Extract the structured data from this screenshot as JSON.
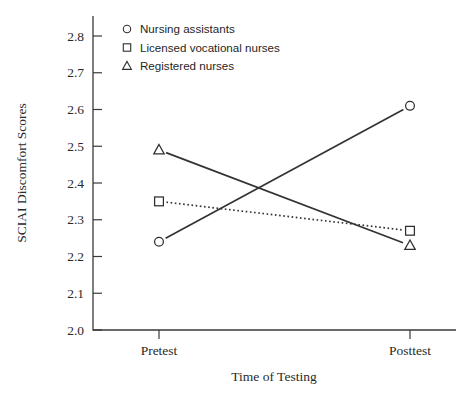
{
  "chart_data": {
    "type": "line",
    "title": "",
    "xlabel": "Time of Testing",
    "ylabel": "SCIAI Discomfort Scores",
    "categories": [
      "Pretest",
      "Posttest"
    ],
    "ylim": [
      2.0,
      2.8
    ],
    "yticks": [
      "2.0",
      "2.1",
      "2.2",
      "2.3",
      "2.4",
      "2.5",
      "2.6",
      "2.7",
      "2.8"
    ],
    "ytick_values": [
      2.0,
      2.1,
      2.2,
      2.3,
      2.4,
      2.5,
      2.6,
      2.7,
      2.8
    ],
    "grid": false,
    "legend_position": "top-left inside",
    "series": [
      {
        "name": "Nursing assistants",
        "marker": "circle",
        "linestyle": "solid",
        "color": "#333333",
        "values": [
          2.24,
          2.61
        ]
      },
      {
        "name": "Licensed vocational nurses",
        "marker": "square",
        "linestyle": "dotted",
        "color": "#333333",
        "values": [
          2.35,
          2.27
        ]
      },
      {
        "name": "Registered nurses",
        "marker": "triangle",
        "linestyle": "solid",
        "color": "#333333",
        "values": [
          2.49,
          2.23
        ]
      }
    ]
  },
  "legend": {
    "items": [
      {
        "label": "Nursing assistants",
        "marker": "circle-marker-icon"
      },
      {
        "label": "Licensed vocational nurses",
        "marker": "square-marker-icon"
      },
      {
        "label": "Registered nurses",
        "marker": "triangle-marker-icon"
      }
    ]
  },
  "axes": {
    "y_title": "SCIAI Discomfort Scores",
    "x_title": "Time of Testing",
    "y_tick_labels": [
      "2.8",
      "2.7",
      "2.6",
      "2.5",
      "2.4",
      "2.3",
      "2.2",
      "2.1",
      "2.0"
    ],
    "x_tick_labels": [
      "Pretest",
      "Posttest"
    ]
  },
  "colors": {
    "axis": "#3a3a3a",
    "line": "#333333",
    "marker_fill": "#ffffff",
    "text": "#2a2a2a",
    "background": "#ffffff"
  }
}
